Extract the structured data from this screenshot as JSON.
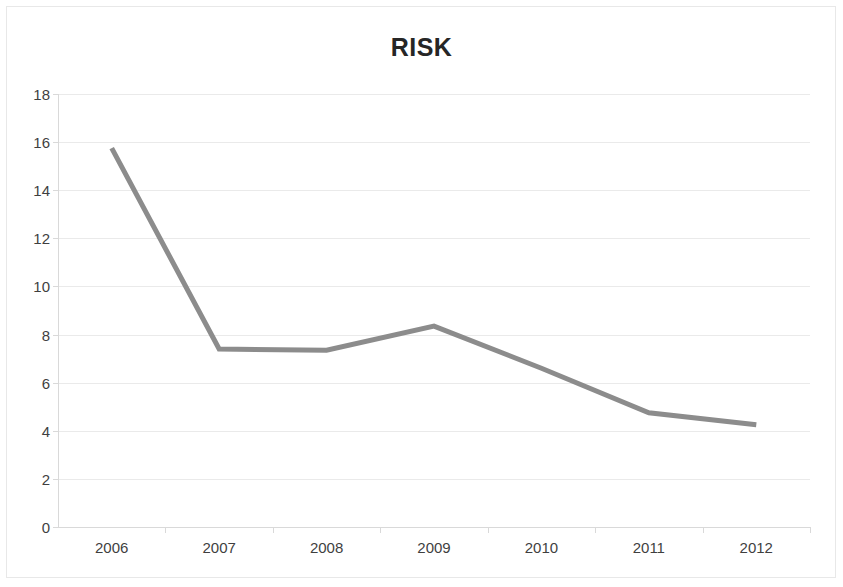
{
  "chart_data": {
    "type": "line",
    "title": "RISK",
    "xlabel": "",
    "ylabel": "",
    "categories": [
      "2006",
      "2007",
      "2008",
      "2009",
      "2010",
      "2011",
      "2012"
    ],
    "values": [
      15.75,
      7.4,
      7.35,
      8.35,
      6.6,
      4.75,
      4.25
    ],
    "series": [
      {
        "name": "RISK",
        "values": [
          15.75,
          7.4,
          7.35,
          8.35,
          6.6,
          4.75,
          4.25
        ],
        "color": "#8c8c8c"
      }
    ],
    "ylim": [
      0,
      18
    ],
    "ytick_labels": [
      "0",
      "2",
      "4",
      "6",
      "8",
      "10",
      "12",
      "14",
      "16",
      "18"
    ],
    "ytick_values": [
      0,
      2,
      4,
      6,
      8,
      10,
      12,
      14,
      16,
      18
    ],
    "grid": true,
    "grid_color": "#eaeaea",
    "legend": false,
    "legend_position": "none",
    "markers": false,
    "line_width": 5,
    "background_color": "#ffffff",
    "title_color": "#262626",
    "axis_color": "#d9d9d9",
    "tick_label_color": "#3f3f3f"
  }
}
